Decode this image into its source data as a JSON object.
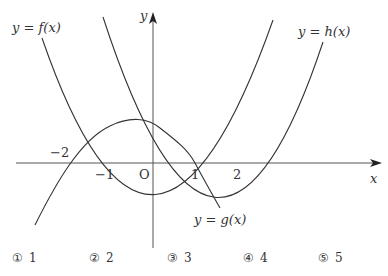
{
  "diagram": {
    "axes": {
      "x_label": "x",
      "y_label": "y",
      "origin_label": "O",
      "x_ticks": [
        "−2",
        "−1",
        "1",
        "2"
      ]
    },
    "curves": [
      {
        "name": "f",
        "label": "y = f(x)",
        "description": "upward parabola with zeros at x = -1 and x = 1"
      },
      {
        "name": "g",
        "label": "y = g(x)",
        "description": "cubic-like curve with zeros at x = -2 and x = 1, decreasing past x = 1"
      },
      {
        "name": "h",
        "label": "y = h(x)",
        "description": "upward parabola with zeros at x = 1 and x = 2"
      }
    ],
    "colors": {
      "stroke": "#333333",
      "axis": "#555555",
      "background": "#ffffff"
    }
  },
  "choices": [
    {
      "marker": "①",
      "value": "1"
    },
    {
      "marker": "②",
      "value": "2"
    },
    {
      "marker": "③",
      "value": "3"
    },
    {
      "marker": "④",
      "value": "4"
    },
    {
      "marker": "⑤",
      "value": "5"
    }
  ]
}
